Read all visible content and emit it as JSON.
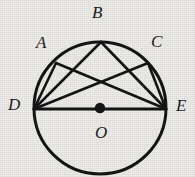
{
  "figure": {
    "name": "circle-with-inscribed-chords",
    "background_color": "#edebe7",
    "stroke_color": "#141414",
    "label_color": "#1b1b1b",
    "canvas": {
      "width": 195,
      "height": 177
    }
  },
  "circle": {
    "name": "main-circle",
    "center": {
      "x": 100,
      "y": 108
    },
    "radius": 66,
    "stroke_width": 3
  },
  "center_dot": {
    "name": "center-point-O",
    "x": 100,
    "y": 108,
    "radius": 5
  },
  "points": [
    {
      "id": "A",
      "label": "A",
      "x": 56,
      "y": 63,
      "label_x": 36,
      "label_y": 34
    },
    {
      "id": "B",
      "label": "B",
      "x": 101,
      "y": 42,
      "label_x": 92,
      "label_y": 4
    },
    {
      "id": "C",
      "label": "C",
      "x": 148,
      "y": 63,
      "label_x": 151,
      "label_y": 33
    },
    {
      "id": "D",
      "label": "D",
      "x": 34,
      "y": 109,
      "label_x": 8,
      "label_y": 96
    },
    {
      "id": "E",
      "label": "E",
      "x": 166,
      "y": 109,
      "label_x": 176,
      "label_y": 97
    },
    {
      "id": "O",
      "label": "O",
      "x": 100,
      "y": 108,
      "label_x": 95,
      "label_y": 124
    }
  ],
  "chords": [
    {
      "name": "chord-D-A",
      "from": "D",
      "to": "A",
      "x1": 34,
      "y1": 109,
      "x2": 56,
      "y2": 63
    },
    {
      "name": "chord-D-B",
      "from": "D",
      "to": "B",
      "x1": 34,
      "y1": 109,
      "x2": 101,
      "y2": 42
    },
    {
      "name": "chord-D-C",
      "from": "D",
      "to": "C",
      "x1": 34,
      "y1": 109,
      "x2": 148,
      "y2": 63
    },
    {
      "name": "diameter-D-E",
      "from": "D",
      "to": "E",
      "x1": 34,
      "y1": 109,
      "x2": 166,
      "y2": 109
    },
    {
      "name": "chord-A-E",
      "from": "A",
      "to": "E",
      "x1": 56,
      "y1": 63,
      "x2": 166,
      "y2": 109
    },
    {
      "name": "chord-B-E",
      "from": "B",
      "to": "E",
      "x1": 101,
      "y1": 42,
      "x2": 166,
      "y2": 109
    },
    {
      "name": "chord-C-E",
      "from": "C",
      "to": "E",
      "x1": 148,
      "y1": 63,
      "x2": 166,
      "y2": 109
    }
  ]
}
